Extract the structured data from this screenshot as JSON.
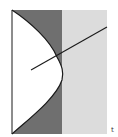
{
  "figure": {
    "label": "t",
    "colors": {
      "background": "#ffffff",
      "dark_region": "#6f6f6f",
      "light_region": "#dcdcdc",
      "stroke": "#1a1a1a"
    },
    "regions": [
      {
        "name": "white-region",
        "description": "curved region bounded by left edge and bulging curve"
      },
      {
        "name": "dark-region",
        "description": "dark shaded band between curve and vertical divider"
      },
      {
        "name": "light-region",
        "description": "light shaded band right of vertical divider"
      }
    ]
  }
}
